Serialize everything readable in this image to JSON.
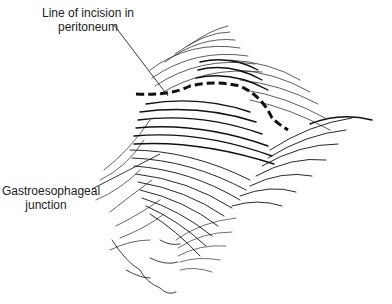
{
  "figure": {
    "labels": {
      "incision_line1": "Line of incision in",
      "incision_line2": "peritoneum",
      "gej_line1": "Gastroesophageal",
      "gej_line2": "junction"
    },
    "colors": {
      "ink": "#111111",
      "background": "#ffffff",
      "text": "#222222"
    }
  }
}
